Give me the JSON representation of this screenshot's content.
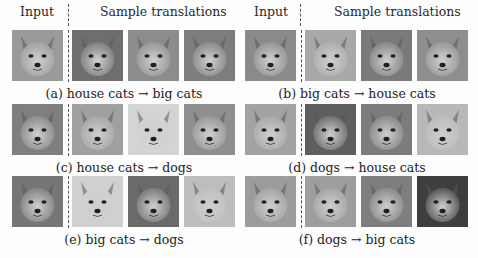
{
  "headers": {
    "left_input": "Input",
    "left_samples": "Sample translations",
    "right_input": "Input",
    "right_samples": "Sample translations"
  },
  "panels": [
    {
      "id": "a",
      "caption": "(a) house cats → big cats",
      "input": {
        "subject": "house cat (tabby kitten)",
        "tone": "#9a9a9a"
      },
      "samples": [
        {
          "subject": "tiger",
          "tone": "#6e6e6e"
        },
        {
          "subject": "lion",
          "tone": "#8c8c8c"
        },
        {
          "subject": "snow leopard",
          "tone": "#7d7d7d"
        }
      ]
    },
    {
      "id": "b",
      "caption": "(b) big cats → house cats",
      "input": {
        "subject": "snow leopard",
        "tone": "#8a8a8a"
      },
      "samples": [
        {
          "subject": "white-orange kitten",
          "tone": "#a8a8a8"
        },
        {
          "subject": "siamese cat",
          "tone": "#7a7a7a"
        },
        {
          "subject": "tabby cat",
          "tone": "#8e8e8e"
        }
      ]
    },
    {
      "id": "c",
      "caption": "(c) house cats → dogs",
      "input": {
        "subject": "tabby kitten",
        "tone": "#7f7f7f"
      },
      "samples": [
        {
          "subject": "corgi",
          "tone": "#a0a0a0"
        },
        {
          "subject": "samoyed",
          "tone": "#d4d4d4"
        },
        {
          "subject": "husky",
          "tone": "#8f8f8f"
        }
      ]
    },
    {
      "id": "d",
      "caption": "(d) dogs → house cats",
      "input": {
        "subject": "corgi",
        "tone": "#a2a2a2"
      },
      "samples": [
        {
          "subject": "tabby cat",
          "tone": "#5e5e5e"
        },
        {
          "subject": "tabby cat",
          "tone": "#7c7c7c"
        },
        {
          "subject": "cream cat",
          "tone": "#b8b8b8"
        }
      ]
    },
    {
      "id": "e",
      "caption": "(e) big cats → dogs",
      "input": {
        "subject": "leopard",
        "tone": "#767676"
      },
      "samples": [
        {
          "subject": "samoyed",
          "tone": "#d0d0d0"
        },
        {
          "subject": "husky",
          "tone": "#6a6a6a"
        },
        {
          "subject": "shiba puppy",
          "tone": "#bdbdbd"
        }
      ]
    },
    {
      "id": "f",
      "caption": "(f) dogs → big cats",
      "input": {
        "subject": "husky",
        "tone": "#9c9c9c"
      },
      "samples": [
        {
          "subject": "white lion",
          "tone": "#9e9e9e"
        },
        {
          "subject": "snow leopard",
          "tone": "#7e7e7e"
        },
        {
          "subject": "black leopard",
          "tone": "#3e3e3e"
        }
      ]
    }
  ]
}
